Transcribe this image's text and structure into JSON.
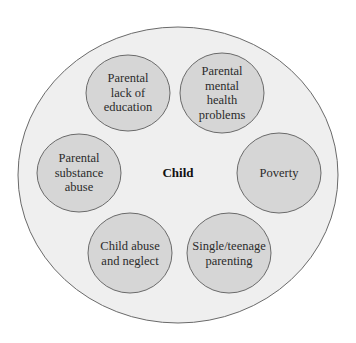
{
  "diagram": {
    "type": "concentric-factors",
    "center_label": "Child",
    "outer_circle": {
      "cx": 178,
      "cy": 175,
      "rx": 160,
      "ry": 148,
      "fill": "#efefef",
      "stroke": "#6a6a6a"
    },
    "factor_style": {
      "fill": "#d6d6d6",
      "stroke": "#6a6a6a"
    },
    "factors": [
      {
        "label": "Parental\nlack of\neducation",
        "cx": 128,
        "cy": 93,
        "rx": 42,
        "ry": 38
      },
      {
        "label": "Parental\nmental\nhealth\nproblems",
        "cx": 222,
        "cy": 93,
        "rx": 42,
        "ry": 40
      },
      {
        "label": "Parental\nsubstance\nabuse",
        "cx": 79,
        "cy": 173,
        "rx": 42,
        "ry": 39
      },
      {
        "label": "Poverty",
        "cx": 279,
        "cy": 173,
        "rx": 42,
        "ry": 40
      },
      {
        "label": "Child abuse\nand neglect",
        "cx": 130,
        "cy": 253,
        "rx": 42,
        "ry": 40
      },
      {
        "label": "Single/teenage\nparenting",
        "cx": 229,
        "cy": 253,
        "rx": 42,
        "ry": 40
      }
    ]
  }
}
